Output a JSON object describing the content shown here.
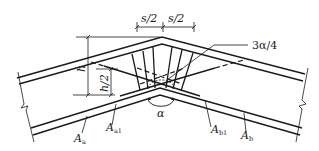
{
  "diagram": {
    "type": "reinforcement-detail",
    "colors": {
      "line": "#1a1a1a",
      "dim": "#333333",
      "background": "#ffffff"
    },
    "labels": {
      "s_half_left": "s/2",
      "s_half_right": "s/2",
      "three_alpha_quarter": "3α/4",
      "h": "h",
      "h_half": "h/2",
      "alpha": "α",
      "A_a": {
        "main": "A",
        "sub": "a"
      },
      "A_a1": {
        "main": "A",
        "sub": "a1"
      },
      "A_b1": {
        "main": "A",
        "sub": "b1"
      },
      "A_b": {
        "main": "A",
        "sub": "b"
      }
    }
  }
}
